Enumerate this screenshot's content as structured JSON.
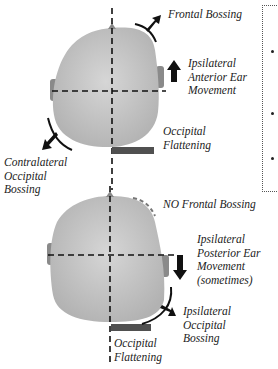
{
  "colors": {
    "head_fill": "#c4c4c4",
    "head_highlight": "#d8d8d8",
    "ear_fill": "#8a8a8a",
    "flattening_bar": "#505050",
    "arrow": "#111111",
    "text": "#222222"
  },
  "top_head": {
    "labels": {
      "frontal_bossing": "Frontal Bossing",
      "ipsilateral_anterior_ear": [
        "Ipsilateral",
        "Anterior Ear",
        "Movement"
      ],
      "occipital_flattening": [
        "Occipital",
        "Flattening"
      ],
      "contralateral_occipital_bossing": [
        "Contralateral",
        "Occipital",
        "Bossing"
      ]
    },
    "icons": [
      "curved-arrow-up-right-icon",
      "arrow-up-icon",
      "curved-arrow-down-left-icon"
    ]
  },
  "bottom_head": {
    "labels": {
      "no_frontal_bossing": "NO Frontal Bossing",
      "ipsilateral_posterior_ear": [
        "Ipsilateral",
        "Posterior Ear",
        "Movement",
        "(sometimes)"
      ],
      "ipsilateral_occipital_bossing": [
        "Ipsilateral",
        "Occipital",
        "Bossing"
      ],
      "occipital_flattening": [
        "Occipital",
        "Flattening"
      ]
    },
    "icons": [
      "dashed-arc-icon",
      "arrow-down-icon",
      "curved-arrow-down-right-icon"
    ]
  },
  "side_panel": {
    "bullet_count": 3
  }
}
